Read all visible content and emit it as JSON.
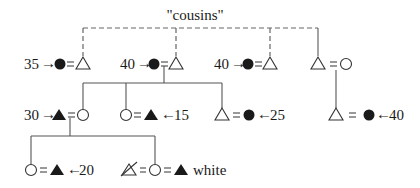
{
  "title_label": "\"cousins\"",
  "colors": {
    "ink": "#1a1a1a",
    "line": "#555555",
    "background": "#ffffff"
  },
  "legend_semantics": {
    "filled-circle": "female (deceased)",
    "open-circle": "female",
    "filled-triangle": "male (deceased)",
    "open-triangle": "male",
    "equals": "marriage",
    "dashed-line": "cousin relationship"
  },
  "row1": {
    "c1_age": "35",
    "c2_age": "40",
    "c3_age": "40"
  },
  "row2": {
    "a_age": "30",
    "b_age": "15",
    "c_age": "25",
    "d_age": "40"
  },
  "row3": {
    "a_age": "20",
    "b_label": "white"
  },
  "arrow_right": "→",
  "arrow_left": "←"
}
